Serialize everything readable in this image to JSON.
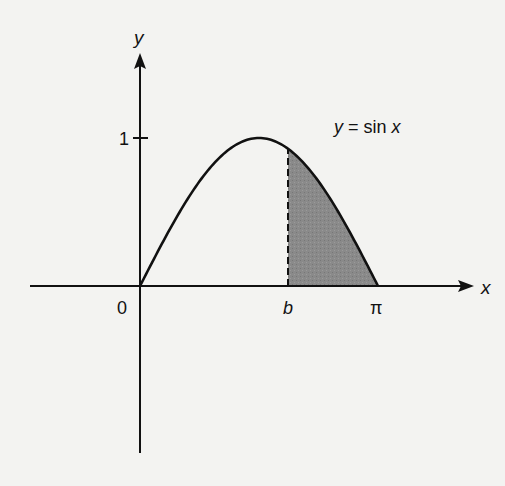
{
  "diagram": {
    "function_label": "y = sin x",
    "function_label_parts": {
      "y": "y",
      "eq": " = sin ",
      "x": "x"
    },
    "x_axis_label": "x",
    "y_axis_label": "y",
    "origin_label": "0",
    "y_tick_label": "1",
    "b_label": "b",
    "pi_label": "π",
    "shaded_region": "area under sin x from b to π",
    "colors": {
      "curve": "#111111",
      "fill": "#8a8a8a",
      "background": "#f3f3f1"
    }
  },
  "chart_data": {
    "type": "area",
    "title": "y = sin x",
    "xlabel": "x",
    "ylabel": "y",
    "function": "sin(x)",
    "domain": [
      0,
      3.14159
    ],
    "shaded_interval": [
      "b",
      "π"
    ],
    "tick_labels": {
      "x": [
        "0",
        "b",
        "π"
      ],
      "y": [
        "1"
      ]
    },
    "grid": false
  }
}
